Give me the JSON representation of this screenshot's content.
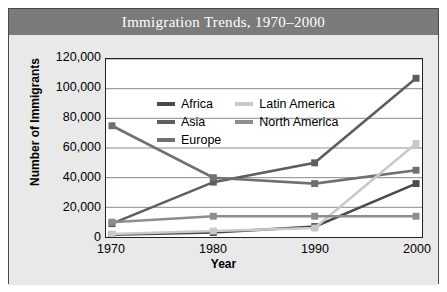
{
  "title": "Immigration Trends, 1970–2000",
  "chart_data": {
    "type": "line",
    "title": "Immigration Trends, 1970–2000",
    "xlabel": "Year",
    "ylabel": "Number of Immigrants",
    "categories": [
      "1970",
      "1980",
      "1990",
      "2000"
    ],
    "x": [
      1970,
      1980,
      1990,
      2000
    ],
    "xlim": [
      1970,
      2000
    ],
    "ylim": [
      0,
      120000
    ],
    "yticks": [
      "0",
      "20,000",
      "40,000",
      "60,000",
      "80,000",
      "100,000",
      "120,000"
    ],
    "ytick_values": [
      0,
      20000,
      40000,
      60000,
      80000,
      100000,
      120000
    ],
    "grid": "horizontal",
    "legend_position": "top-center-inside",
    "markers": "square",
    "series": [
      {
        "name": "Africa",
        "color": "#4a4a4a",
        "values": [
          1500,
          3000,
          7000,
          36000
        ]
      },
      {
        "name": "Asia",
        "color": "#5e5e5e",
        "values": [
          9000,
          37000,
          50000,
          107000
        ]
      },
      {
        "name": "Europe",
        "color": "#707070",
        "values": [
          75000,
          40000,
          36000,
          45000
        ]
      },
      {
        "name": "Latin America",
        "color": "#c9c9c9",
        "values": [
          2000,
          4000,
          6000,
          63000
        ]
      },
      {
        "name": "North America",
        "color": "#8d8d8d",
        "values": [
          10000,
          14000,
          14000,
          14000
        ]
      }
    ]
  },
  "legend": {
    "columns": [
      [
        {
          "label": "Africa",
          "color": "#4a4a4a"
        },
        {
          "label": "Asia",
          "color": "#5e5e5e"
        },
        {
          "label": "Europe",
          "color": "#707070"
        }
      ],
      [
        {
          "label": "Latin America",
          "color": "#c9c9c9"
        },
        {
          "label": "North America",
          "color": "#8d8d8d"
        }
      ]
    ]
  }
}
